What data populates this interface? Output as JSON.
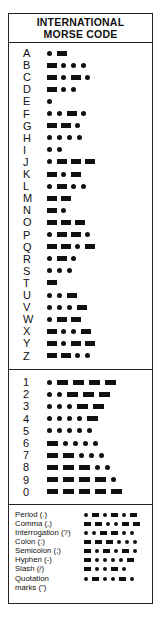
{
  "title": {
    "line1": "INTERNATIONAL",
    "line2": "MORSE CODE"
  },
  "symbols": {
    "dot": "dot-icon",
    "dash": "dash-icon"
  },
  "letters": [
    {
      "char": "A",
      "code": ".-"
    },
    {
      "char": "B",
      "code": "-..."
    },
    {
      "char": "C",
      "code": "-.-."
    },
    {
      "char": "D",
      "code": "-.."
    },
    {
      "char": "E",
      "code": "."
    },
    {
      "char": "F",
      "code": "..-."
    },
    {
      "char": "G",
      "code": "--."
    },
    {
      "char": "H",
      "code": "...."
    },
    {
      "char": "I",
      "code": ".."
    },
    {
      "char": "J",
      "code": ".---"
    },
    {
      "char": "K",
      "code": "-.-"
    },
    {
      "char": "L",
      "code": ".-.."
    },
    {
      "char": "M",
      "code": "--"
    },
    {
      "char": "N",
      "code": "-."
    },
    {
      "char": "O",
      "code": "---"
    },
    {
      "char": "P",
      "code": ".--."
    },
    {
      "char": "Q",
      "code": "--.-"
    },
    {
      "char": "R",
      "code": ".-."
    },
    {
      "char": "S",
      "code": "..."
    },
    {
      "char": "T",
      "code": "-"
    },
    {
      "char": "U",
      "code": "..-"
    },
    {
      "char": "V",
      "code": "...-"
    },
    {
      "char": "W",
      "code": ".--"
    },
    {
      "char": "X",
      "code": "-..-"
    },
    {
      "char": "Y",
      "code": "-.--"
    },
    {
      "char": "Z",
      "code": "--.."
    }
  ],
  "numbers": [
    {
      "char": "1",
      "code": ".----"
    },
    {
      "char": "2",
      "code": "..---"
    },
    {
      "char": "3",
      "code": "...--"
    },
    {
      "char": "4",
      "code": "....-"
    },
    {
      "char": "5",
      "code": "....."
    },
    {
      "char": "6",
      "code": "-...."
    },
    {
      "char": "7",
      "code": "--..."
    },
    {
      "char": "8",
      "code": "---.."
    },
    {
      "char": "9",
      "code": "----."
    },
    {
      "char": "0",
      "code": "-----"
    }
  ],
  "punctuation": [
    {
      "label": "Period (.)",
      "code": ".-.-.-"
    },
    {
      "label": "Comma (,)",
      "code": "--..--"
    },
    {
      "label": "Interrogation (?)",
      "code": "..--.."
    },
    {
      "label": "Colon (:)",
      "code": "---..."
    },
    {
      "label": "Semicolon (;)",
      "code": "-.-.-."
    },
    {
      "label": "Hyphen (-)",
      "code": "-....-"
    },
    {
      "label": "Slash (/)",
      "code": "-..-."
    },
    {
      "label": "Quotation marks (\")",
      "label_line1": "Quotation",
      "label_line2": "marks (\")",
      "code": ".-..-."
    }
  ]
}
